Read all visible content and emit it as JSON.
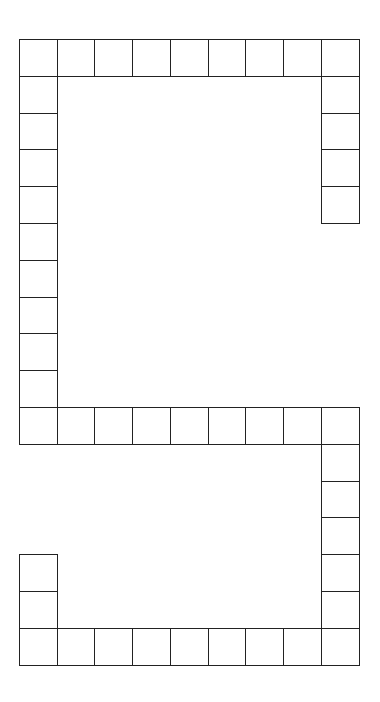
{
  "board": {
    "origin_x": 19,
    "origin_y": 39,
    "cell_w": 37.7,
    "cell_h": 36.8,
    "line_color": "#222222",
    "cells": [
      [
        0,
        0
      ],
      [
        1,
        0
      ],
      [
        2,
        0
      ],
      [
        3,
        0
      ],
      [
        4,
        0
      ],
      [
        5,
        0
      ],
      [
        6,
        0
      ],
      [
        7,
        0
      ],
      [
        8,
        0
      ],
      [
        8,
        1
      ],
      [
        8,
        2
      ],
      [
        8,
        3
      ],
      [
        8,
        4
      ],
      [
        0,
        1
      ],
      [
        0,
        2
      ],
      [
        0,
        3
      ],
      [
        0,
        4
      ],
      [
        0,
        5
      ],
      [
        0,
        6
      ],
      [
        0,
        7
      ],
      [
        0,
        8
      ],
      [
        0,
        9
      ],
      [
        0,
        10
      ],
      [
        1,
        10
      ],
      [
        2,
        10
      ],
      [
        3,
        10
      ],
      [
        4,
        10
      ],
      [
        5,
        10
      ],
      [
        6,
        10
      ],
      [
        7,
        10
      ],
      [
        8,
        10
      ],
      [
        8,
        11
      ],
      [
        8,
        12
      ],
      [
        8,
        13
      ],
      [
        8,
        14
      ],
      [
        8,
        15
      ],
      [
        0,
        16
      ],
      [
        1,
        16
      ],
      [
        2,
        16
      ],
      [
        3,
        16
      ],
      [
        4,
        16
      ],
      [
        5,
        16
      ],
      [
        6,
        16
      ],
      [
        7,
        16
      ],
      [
        8,
        16
      ],
      [
        0,
        14
      ],
      [
        0,
        15
      ]
    ]
  }
}
